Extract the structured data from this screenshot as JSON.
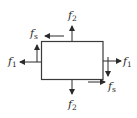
{
  "diagram": {
    "title": "",
    "stroke_color": "#3a3a3a",
    "labels": {
      "top_force": {
        "base": "f",
        "sub": "2"
      },
      "bottom_force": {
        "base": "f",
        "sub": "2"
      },
      "left_force": {
        "base": "f",
        "sub": "1"
      },
      "right_force": {
        "base": "f",
        "sub": "1"
      },
      "top_shear": {
        "base": "f",
        "sub": "s"
      },
      "bottom_shear": {
        "base": "f",
        "sub": "s"
      }
    }
  }
}
